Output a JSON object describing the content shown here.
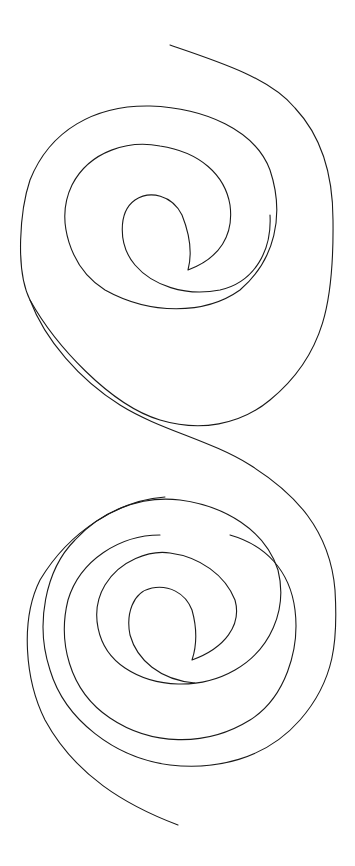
{
  "canvas": {
    "width": 355,
    "height": 866,
    "background": "#ffffff"
  },
  "drawing": {
    "description": "Double spiral line art (two vertically stacked spirals joined by an S-curve)",
    "stroke_color": "#1a1a1a",
    "stroke_width": 1.1,
    "spirals": [
      {
        "name": "top-spiral",
        "center": [
          180,
          255
        ],
        "cusp": [
          188,
          270
        ]
      },
      {
        "name": "bottom-spiral",
        "center": [
          185,
          655
        ],
        "cusp": [
          192,
          660
        ]
      }
    ]
  }
}
